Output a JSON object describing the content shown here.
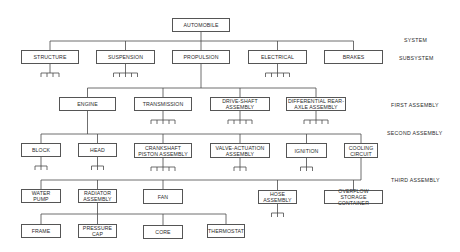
{
  "diagram": {
    "title": "AUTOMOBILE",
    "level_labels": [
      {
        "id": "system",
        "text": "SYSTEM",
        "x": 404,
        "y": 37
      },
      {
        "id": "subsystem",
        "text": "SUBSYSTEM",
        "x": 399,
        "y": 55
      },
      {
        "id": "first-assembly",
        "text": "FIRST ASSEMBLY",
        "x": 391,
        "y": 102
      },
      {
        "id": "second-assembly",
        "text": "SECOND ASSEMBLY",
        "x": 387,
        "y": 130
      },
      {
        "id": "third-assembly",
        "text": "THIRD ASSEMBLY",
        "x": 391,
        "y": 177
      }
    ],
    "nodes": [
      {
        "id": "automobile",
        "label": "AUTOMOBILE",
        "x": 172,
        "y": 18,
        "w": 58,
        "h": 14
      },
      {
        "id": "structure",
        "label": "STRUCTURE",
        "x": 21,
        "y": 50,
        "w": 58,
        "h": 14
      },
      {
        "id": "suspension",
        "label": "SUSPENSION",
        "x": 96,
        "y": 50,
        "w": 59,
        "h": 14
      },
      {
        "id": "propulsion",
        "label": "PROPULSION",
        "x": 172,
        "y": 50,
        "w": 58,
        "h": 14
      },
      {
        "id": "electrical",
        "label": "ELECTRICAL",
        "x": 248,
        "y": 50,
        "w": 59,
        "h": 14
      },
      {
        "id": "brakes",
        "label": "BRAKES",
        "x": 324,
        "y": 50,
        "w": 59,
        "h": 14
      },
      {
        "id": "engine",
        "label": "ENGINE",
        "x": 59,
        "y": 97,
        "w": 57,
        "h": 14
      },
      {
        "id": "transmission",
        "label": "TRANSMISSION",
        "x": 134,
        "y": 97,
        "w": 58,
        "h": 14
      },
      {
        "id": "drive-shaft",
        "label": "DRIVE-SHAFT\nASSEMBLY",
        "x": 210,
        "y": 97,
        "w": 60,
        "h": 14
      },
      {
        "id": "differential",
        "label": "DIFFERENTIAL REAR-\nAXLE ASSEMBLY",
        "x": 286,
        "y": 97,
        "w": 60,
        "h": 14
      },
      {
        "id": "block",
        "label": "BLOCK",
        "x": 21,
        "y": 143,
        "w": 40,
        "h": 14
      },
      {
        "id": "head",
        "label": "HEAD",
        "x": 78,
        "y": 143,
        "w": 39,
        "h": 14
      },
      {
        "id": "crankshaft",
        "label": "CRANKSHAFT\nPISTON ASSEMBLY",
        "x": 134,
        "y": 143,
        "w": 58,
        "h": 15
      },
      {
        "id": "valve-actuation",
        "label": "VALVE-ACTUATION\nASSEMBLY",
        "x": 210,
        "y": 143,
        "w": 60,
        "h": 15
      },
      {
        "id": "ignition",
        "label": "IGNITION",
        "x": 286,
        "y": 143,
        "w": 41,
        "h": 15
      },
      {
        "id": "cooling-circuit",
        "label": "COOLING\nCIRCUIT",
        "x": 344,
        "y": 143,
        "w": 34,
        "h": 15
      },
      {
        "id": "water-pump",
        "label": "WATER\nPUMP",
        "x": 21,
        "y": 189,
        "w": 40,
        "h": 14
      },
      {
        "id": "radiator",
        "label": "RADIATOR\nASSEMBLY",
        "x": 78,
        "y": 189,
        "w": 39,
        "h": 14
      },
      {
        "id": "fan",
        "label": "FAN",
        "x": 143,
        "y": 189,
        "w": 40,
        "h": 15
      },
      {
        "id": "hose-assembly",
        "label": "HOSE\nASSEMBLY",
        "x": 258,
        "y": 190,
        "w": 39,
        "h": 14
      },
      {
        "id": "overflow",
        "label": "OVERFLOW STORAGE\nCONTAINER",
        "x": 324,
        "y": 190,
        "w": 59,
        "h": 14
      },
      {
        "id": "frame",
        "label": "FRAME",
        "x": 21,
        "y": 224,
        "w": 40,
        "h": 14
      },
      {
        "id": "pressure-cap",
        "label": "PRESSURE\nCAP",
        "x": 78,
        "y": 224,
        "w": 39,
        "h": 14
      },
      {
        "id": "core",
        "label": "CORE",
        "x": 143,
        "y": 225,
        "w": 40,
        "h": 14
      },
      {
        "id": "thermostat",
        "label": "THERMOSTAT",
        "x": 207,
        "y": 224,
        "w": 38,
        "h": 14
      }
    ],
    "edges": [
      {
        "from": "automobile",
        "to": [
          "structure",
          "suspension",
          "propulsion",
          "electrical",
          "brakes"
        ],
        "bus_y": 41
      },
      {
        "from": "propulsion",
        "to": [
          "engine",
          "transmission",
          "drive-shaft",
          "differential"
        ],
        "bus_y": 88
      },
      {
        "from": "engine",
        "to": [
          "block",
          "head",
          "crankshaft",
          "valve-actuation",
          "ignition",
          "cooling-circuit"
        ],
        "bus_y": 134
      },
      {
        "from": "cooling-circuit",
        "to": [
          "water-pump",
          "radiator",
          "fan",
          "hose-assembly",
          "overflow"
        ],
        "bus_y": 180
      },
      {
        "from": "radiator",
        "to": [
          "frame",
          "pressure-cap",
          "core",
          "thermostat"
        ],
        "bus_y": 214
      }
    ],
    "stubs": [
      {
        "under": "structure",
        "branches": 4
      },
      {
        "under": "suspension",
        "branches": 5
      },
      {
        "under": "electrical",
        "branches": 5
      },
      {
        "under": "transmission",
        "branches": 5
      },
      {
        "under": "drive-shaft",
        "branches": 5
      },
      {
        "under": "differential",
        "branches": 5
      },
      {
        "under": "block",
        "branches": 3
      },
      {
        "under": "head",
        "branches": 3
      },
      {
        "under": "crankshaft",
        "branches": 5
      },
      {
        "under": "valve-actuation",
        "branches": 3
      },
      {
        "under": "ignition",
        "branches": 3
      },
      {
        "under": "hose-assembly",
        "branches": 3
      }
    ]
  }
}
